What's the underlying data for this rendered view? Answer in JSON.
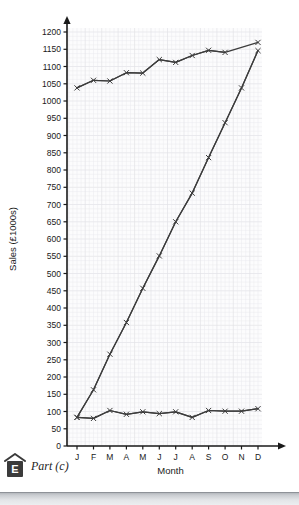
{
  "chart_data": {
    "type": "line",
    "title": "",
    "xlabel": "Month",
    "ylabel": "Sales (£1000s)",
    "categories": [
      "J",
      "F",
      "M",
      "A",
      "M",
      "J",
      "J",
      "A",
      "S",
      "O",
      "N",
      "D"
    ],
    "category_names": [
      "January",
      "February",
      "March",
      "April",
      "May",
      "June",
      "July",
      "August",
      "September",
      "October",
      "November",
      "December"
    ],
    "ylim": [
      0,
      1200
    ],
    "ytick_step": 50,
    "yticks": [
      0,
      50,
      100,
      150,
      200,
      250,
      300,
      350,
      400,
      450,
      500,
      550,
      600,
      650,
      700,
      750,
      800,
      850,
      900,
      950,
      1000,
      1050,
      1100,
      1150,
      1200
    ],
    "grid": true,
    "legend": "none",
    "marker": "cross",
    "series": [
      {
        "name": "Moving average",
        "values": [
          1038,
          1060,
          1058,
          1082,
          1081,
          1120,
          1112,
          1132,
          1147,
          1141,
          null,
          1170
        ]
      },
      {
        "name": "Monthly sales",
        "values": [
          83,
          80,
          103,
          92,
          99,
          94,
          99,
          83,
          103,
          101,
          101,
          108
        ]
      },
      {
        "name": "Cumulative sales",
        "values": [
          83,
          163,
          266,
          358,
          457,
          551,
          650,
          733,
          836,
          937,
          1038,
          1146
        ]
      }
    ]
  },
  "footer": {
    "badge_letter": "E",
    "part_label": "Part (c)"
  },
  "colors": {
    "line": "#3c3c3c",
    "axis": "#1a1a1a",
    "grid": "#e9e9ec",
    "grid_major": "#e2e2e6",
    "plot_bg": "#fcfcfd",
    "badge_bg": "#3b3b3b"
  }
}
